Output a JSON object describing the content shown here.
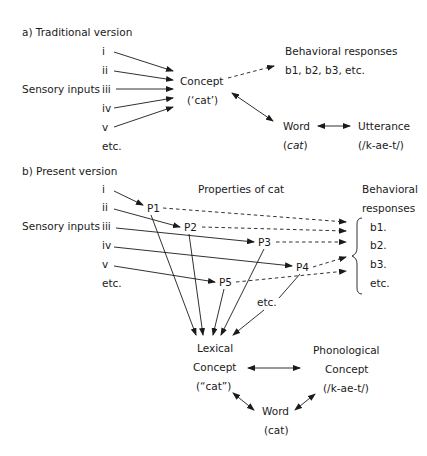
{
  "section_a": {
    "title": "a) Traditional version",
    "sensory_label": "Sensory inputs",
    "inputs": [
      "i",
      "ii",
      "iii",
      "iv",
      "v",
      "etc."
    ],
    "concept": {
      "line1": "Concept",
      "line2": "(‘cat’)"
    },
    "behavioral": {
      "line1": "Behavioral responses",
      "line2": "b1, b2, b3, etc."
    },
    "word": {
      "line1": "Word",
      "line2": "cat",
      "paren_open": "(",
      "paren_close": ")"
    },
    "utterance": {
      "line1": "Utterance",
      "line2": "(/k-ae-t/)"
    }
  },
  "section_b": {
    "title": "b) Present version",
    "sensory_label": "Sensory inputs",
    "inputs": [
      "i",
      "ii",
      "iii",
      "iv",
      "v",
      "etc."
    ],
    "properties_label": "Properties of cat",
    "properties": [
      "P1",
      "P2",
      "P3",
      "P4",
      "P5"
    ],
    "properties_etc": "etc.",
    "behavioral": {
      "line1": "Behavioral",
      "line2": "responses",
      "items": [
        "b1.",
        "b2.",
        "b3.",
        "etc."
      ]
    },
    "lexical": {
      "line1": "Lexical",
      "line2": "Concept",
      "line3": "(“cat”)"
    },
    "phonological": {
      "line1": "Phonological",
      "line2": "Concept",
      "line3": "(/k-ae-t/)"
    },
    "word": {
      "line1": "Word",
      "line2": "(cat)"
    }
  }
}
